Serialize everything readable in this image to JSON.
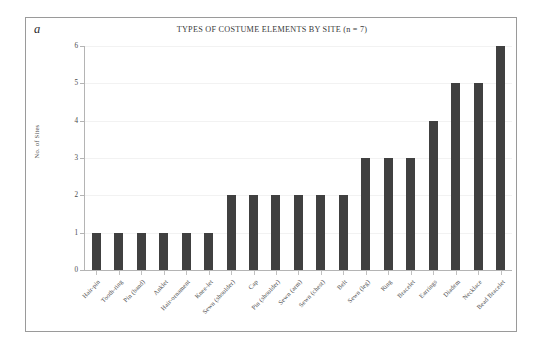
{
  "figure": {
    "panel_label": "a",
    "title": "TYPES OF COSTUME ELEMENTS BY SITE (n = 7)"
  },
  "chart_data": {
    "type": "bar",
    "title": "TYPES OF COSTUME ELEMENTS BY SITE (n = 7)",
    "xlabel": "",
    "ylabel": "No. of Sites",
    "ylim": [
      0,
      6
    ],
    "yticks": [
      0,
      1,
      2,
      3,
      4,
      5,
      6
    ],
    "grid": false,
    "legend": "none",
    "bar_color": "#404040",
    "categories": [
      "Hair-pin",
      "Tooth-ring",
      "Pin (band)",
      "Anklet",
      "Hair-ornament",
      "Knee-let",
      "Sewn (shoulder)",
      "Cap",
      "Pin (shoulder)",
      "Sewn (arm)",
      "Sewn (chest)",
      "Belt",
      "Sewn (leg)",
      "Ring",
      "Bracelet",
      "Earrings",
      "Diadem",
      "Necklace",
      "Bead Bracelet"
    ],
    "values": [
      1,
      1,
      1,
      1,
      1,
      1,
      2,
      2,
      2,
      2,
      2,
      2,
      3,
      3,
      3,
      4,
      5,
      5,
      6
    ]
  }
}
